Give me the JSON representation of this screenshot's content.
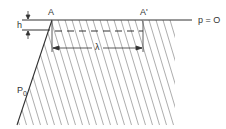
{
  "diagram": {
    "labels": {
      "point_a": "A",
      "point_a_prime": "A'",
      "surface_pressure": "p = O",
      "height": "h",
      "wavelength": "λ",
      "initial_pressure": "P",
      "initial_pressure_sub": "0"
    },
    "colors": {
      "line": "#333333",
      "hatch": "#8a8a8a",
      "background": "#ffffff"
    }
  }
}
